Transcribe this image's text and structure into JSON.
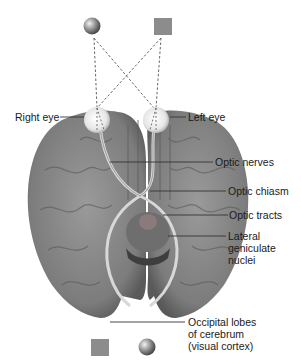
{
  "diagram": {
    "objects": {
      "top_left": "sphere",
      "top_right": "square",
      "bottom_left": "square",
      "bottom_right": "sphere"
    },
    "labels": {
      "right_eye": "Right eye",
      "left_eye": "Left eye",
      "optic_nerves": "Optic nerves",
      "optic_chiasm": "Optic chiasm",
      "optic_tracts": "Optic tracts",
      "lgn_1": "Lateral",
      "lgn_2": "geniculate",
      "lgn_3": "nuclei",
      "occipital_1": "Occipital lobes",
      "occipital_2": "of cerebrum",
      "occipital_3": "(visual cortex)"
    },
    "colors": {
      "brain": "#8a8a8a",
      "brain_dark": "#5e5e5e",
      "square": "#8c8c8c",
      "leader_line": "#333333"
    }
  }
}
